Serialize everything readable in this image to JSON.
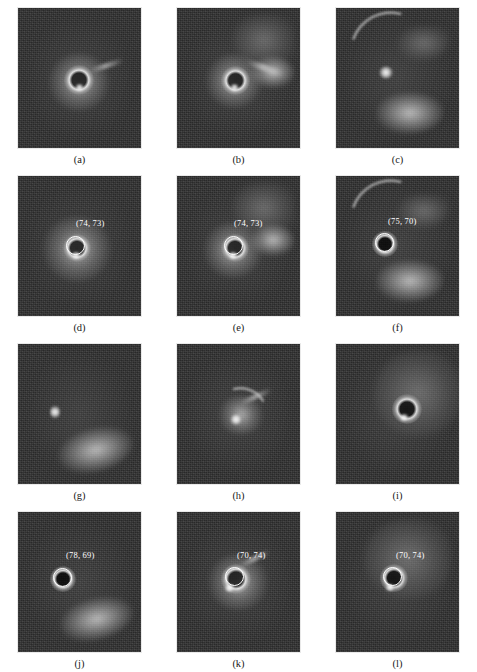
{
  "figure": {
    "columns": 3,
    "rows": 4,
    "background_color": "#ffffff",
    "panel_background_color": "#2e2e2e",
    "annotation_color": "#ffffff",
    "caption_color": "#1a1a1a"
  },
  "panels": [
    {
      "caption": "(a)",
      "coordinate_label": "",
      "has_marker": false,
      "description": "bright ring with diffuse halo on dark noisy background"
    },
    {
      "caption": "(b)",
      "coordinate_label": "",
      "has_marker": false,
      "description": "bright ring with fan-shaped wedge extending upper right"
    },
    {
      "caption": "(c)",
      "coordinate_label": "",
      "has_marker": false,
      "description": "sweeping arc from upper left, bright core, bright crescent blob lower right"
    },
    {
      "caption": "(d)",
      "coordinate_label": "(74, 73)",
      "has_marker": true,
      "description": "bright ring with circle marker and coordinate annotation"
    },
    {
      "caption": "(e)",
      "coordinate_label": "(74, 73)",
      "has_marker": true,
      "description": "ring with wedge structure, circle marker and coordinate annotation"
    },
    {
      "caption": "(f)",
      "coordinate_label": "(75, 70)",
      "has_marker": true,
      "description": "arc, core and crescent blob with circle marker and coordinate annotation"
    },
    {
      "caption": "(g)",
      "coordinate_label": "",
      "has_marker": false,
      "description": "small bright spot with large crescent in lower right"
    },
    {
      "caption": "(h)",
      "coordinate_label": "",
      "has_marker": false,
      "description": "bright hook-shaped core with trailing arc"
    },
    {
      "caption": "(i)",
      "coordinate_label": "",
      "has_marker": false,
      "description": "large diffuse lobe upper right with bright ring"
    },
    {
      "caption": "(j)",
      "coordinate_label": "(78, 69)",
      "has_marker": true,
      "description": "circle marker with crescent in lower right and coordinate annotation"
    },
    {
      "caption": "(k)",
      "coordinate_label": "(70, 74)",
      "has_marker": true,
      "description": "bright ring with circle marker and coordinate annotation"
    },
    {
      "caption": "(l)",
      "coordinate_label": "(70, 74)",
      "has_marker": true,
      "description": "diffuse lobe with bright ring, circle marker and coordinate annotation"
    }
  ]
}
